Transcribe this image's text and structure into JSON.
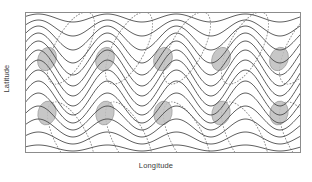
{
  "figure": {
    "kind": "schematic-diagram",
    "background": "#ffffff"
  },
  "axes": {
    "x_label": "Longitude",
    "y_label": "Latitude",
    "border_color": "#8c8c8c",
    "border_width": 1,
    "plot_box": {
      "x": 25,
      "y": 12,
      "width": 276,
      "height": 141
    }
  },
  "chart_data": {
    "type": "line",
    "title": "",
    "xlabel": "Longitude",
    "ylabel": "Latitude",
    "grid": false,
    "legend": null,
    "xlim": [
      0,
      276
    ],
    "ylim": [
      0,
      141
    ],
    "series": [
      {
        "name": "streamline-contours",
        "style": "solid",
        "color": "#4d4d4d",
        "width": 0.9,
        "count": 14,
        "wave_cycles": 4,
        "baselines": [
          6,
          16,
          26,
          36,
          46,
          56,
          66,
          76,
          86,
          96,
          106,
          116,
          126,
          136
        ],
        "amplitudes": [
          4,
          8,
          12,
          15,
          17,
          18,
          18,
          18,
          17,
          15,
          12,
          9,
          6,
          3
        ],
        "phase_deg": 200
      },
      {
        "name": "eddy-loops",
        "style": "dotted",
        "color": "#8f8f8f",
        "width": 0.9,
        "count": 10,
        "shape": "tilted-ellipse",
        "rx": 16,
        "ry": 40,
        "rotation_deg": 28,
        "centers": [
          {
            "x": 46,
            "y": 36
          },
          {
            "x": 46,
            "y": 126
          },
          {
            "x": 104,
            "y": 36
          },
          {
            "x": 104,
            "y": 126
          },
          {
            "x": 162,
            "y": 36
          },
          {
            "x": 162,
            "y": 126
          },
          {
            "x": 220,
            "y": 36
          },
          {
            "x": 220,
            "y": 126
          },
          {
            "x": 278,
            "y": 36
          },
          {
            "x": 278,
            "y": 126
          }
        ]
      },
      {
        "name": "blocking-blobs",
        "style": "filled",
        "fill": "#bdbdbd",
        "stroke": "#9a9a9a",
        "opacity": 0.85,
        "count": 10,
        "rx": 9,
        "ry": 12,
        "rotation_deg": 20,
        "centers": [
          {
            "x": 22,
            "y": 47
          },
          {
            "x": 22,
            "y": 101
          },
          {
            "x": 80,
            "y": 47
          },
          {
            "x": 80,
            "y": 101
          },
          {
            "x": 138,
            "y": 47
          },
          {
            "x": 138,
            "y": 101
          },
          {
            "x": 196,
            "y": 47
          },
          {
            "x": 196,
            "y": 101
          },
          {
            "x": 254,
            "y": 47
          },
          {
            "x": 254,
            "y": 101
          }
        ]
      }
    ]
  },
  "colors": {
    "line": "#4d4d4d",
    "dotted": "#8f8f8f",
    "blob_fill": "#bdbdbd",
    "blob_stroke": "#9a9a9a",
    "border": "#8c8c8c",
    "text": "#3b3b3b"
  }
}
